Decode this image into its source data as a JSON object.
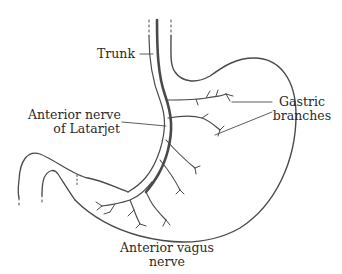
{
  "figure": {
    "colors": {
      "background": "#ffffff",
      "line": "#4a4a4a",
      "text": "#2a2a2a"
    },
    "labels": {
      "trunk": "Trunk",
      "latarjet": {
        "line1": "Anterior nerve",
        "line2": "of Latarjet"
      },
      "gastric_branches": {
        "line1": "Gastric",
        "line2": "branches"
      },
      "anterior_vagus": {
        "line1": "Anterior vagus",
        "line2": "nerve"
      }
    }
  }
}
